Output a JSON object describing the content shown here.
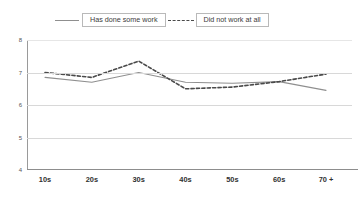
{
  "chart_data": {
    "type": "line",
    "title": "",
    "xlabel": "",
    "ylabel": "",
    "categories": [
      "10s",
      "20s",
      "30s",
      "40s",
      "50s",
      "60s",
      "70 +"
    ],
    "yticks": [
      8,
      7,
      6,
      5,
      4
    ],
    "ylim": [
      4,
      8
    ],
    "grid": true,
    "legend_position": "top",
    "series": [
      {
        "name": "Has done some work",
        "style": "solid",
        "color": "#8f8f8f",
        "values": [
          6.85,
          6.7,
          7.0,
          6.7,
          6.67,
          6.72,
          6.45
        ]
      },
      {
        "name": "Did not work at all",
        "style": "dashed",
        "color": "#4a4a4a",
        "values": [
          7.0,
          6.85,
          7.35,
          6.5,
          6.55,
          6.72,
          6.95
        ]
      }
    ]
  },
  "legend": {
    "entries": [
      {
        "label": "Has done some work",
        "sample": "solid-line-sample"
      },
      {
        "label": "Did not work at all",
        "sample": "dashed-line-sample"
      }
    ]
  },
  "axes": {
    "y": {
      "labels": [
        "8",
        "7",
        "6",
        "5",
        "4"
      ]
    },
    "x": {
      "labels": [
        "10s",
        "20s",
        "30s",
        "40s",
        "50s",
        "60s",
        "70 +"
      ]
    }
  }
}
